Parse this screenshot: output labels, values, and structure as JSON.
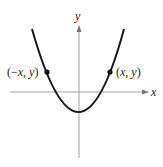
{
  "figure": {
    "axes": {
      "x_label": "x",
      "y_label": "y"
    },
    "curve": {
      "description": "upward-opening parabola symmetric about the y-axis, vertex below origin",
      "equation_form": "y = a*x^2 + c",
      "vertex_y_sign": "negative"
    },
    "points": [
      {
        "label": "(−x, y)",
        "side": "left"
      },
      {
        "label": "(x, y)",
        "side": "right"
      }
    ],
    "colors": {
      "curve": "#1a1a1a",
      "axes": "#777777",
      "text": "#222222"
    }
  }
}
